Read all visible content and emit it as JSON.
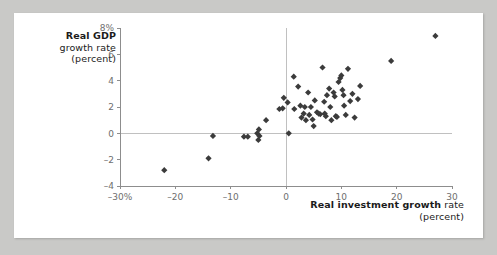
{
  "page": {
    "background_color": "#c9c9c7",
    "card_background": "#ffffff"
  },
  "axes": {
    "y_title_strong": "Real GDP",
    "y_title_rest": "growth rate (percent)",
    "x_title_strong": "Real investment growth",
    "x_title_rest": "rate (percent)"
  },
  "chart_data": {
    "type": "scatter",
    "title": "",
    "xlabel": "Real investment growth rate (percent)",
    "ylabel": "Real GDP growth rate (percent)",
    "xlim": [
      -30,
      30
    ],
    "ylim": [
      -4,
      8
    ],
    "xticks": [
      -30,
      -20,
      -10,
      0,
      10,
      20,
      30
    ],
    "xticklabels": [
      "-30%",
      "-20",
      "-10",
      "0",
      "10",
      "20",
      "30"
    ],
    "yticks": [
      -4,
      -2,
      0,
      2,
      4,
      6,
      8
    ],
    "yticklabels": [
      "-4",
      "-2",
      "0",
      "2",
      "4",
      "6",
      "8%"
    ],
    "grid": false,
    "legend": null,
    "marker_color": "#3b3b3b",
    "marker_shape": "diamond",
    "marker_size": 4,
    "zero_lines": {
      "x": 0,
      "y": 0,
      "color": "#c0c0c0"
    },
    "points": [
      [
        -22.0,
        -2.8
      ],
      [
        -14.0,
        -1.9
      ],
      [
        -13.2,
        -0.2
      ],
      [
        -7.6,
        -0.25
      ],
      [
        -6.9,
        -0.25
      ],
      [
        -5.2,
        0.0
      ],
      [
        -5.0,
        -0.5
      ],
      [
        -4.9,
        0.3
      ],
      [
        -4.8,
        -0.2
      ],
      [
        -3.6,
        1.0
      ],
      [
        -1.2,
        1.85
      ],
      [
        -0.6,
        1.9
      ],
      [
        -0.4,
        2.7
      ],
      [
        1.4,
        4.3
      ],
      [
        1.5,
        1.85
      ],
      [
        2.2,
        3.55
      ],
      [
        0.3,
        2.35
      ],
      [
        0.5,
        0.0
      ],
      [
        2.6,
        2.1
      ],
      [
        2.8,
        1.2
      ],
      [
        3.2,
        1.5
      ],
      [
        3.4,
        2.0
      ],
      [
        3.6,
        1.0
      ],
      [
        4.0,
        3.1
      ],
      [
        4.2,
        1.4
      ],
      [
        4.5,
        2.0
      ],
      [
        4.8,
        1.05
      ],
      [
        5.0,
        0.55
      ],
      [
        5.2,
        2.5
      ],
      [
        5.6,
        1.6
      ],
      [
        5.9,
        1.5
      ],
      [
        6.2,
        1.45
      ],
      [
        6.6,
        5.0
      ],
      [
        6.9,
        2.4
      ],
      [
        7.0,
        1.5
      ],
      [
        7.2,
        1.3
      ],
      [
        7.4,
        2.9
      ],
      [
        7.8,
        3.4
      ],
      [
        8.0,
        2.0
      ],
      [
        8.2,
        1.0
      ],
      [
        8.6,
        3.1
      ],
      [
        8.8,
        2.8
      ],
      [
        9.0,
        1.3
      ],
      [
        9.2,
        1.25
      ],
      [
        9.5,
        3.9
      ],
      [
        9.8,
        4.2
      ],
      [
        10.0,
        4.4
      ],
      [
        10.2,
        3.3
      ],
      [
        10.4,
        2.9
      ],
      [
        10.5,
        2.1
      ],
      [
        10.8,
        1.4
      ],
      [
        11.2,
        4.9
      ],
      [
        11.6,
        2.45
      ],
      [
        12.0,
        3.0
      ],
      [
        12.4,
        1.2
      ],
      [
        13.0,
        2.6
      ],
      [
        13.4,
        3.6
      ],
      [
        19.0,
        5.5
      ],
      [
        27.0,
        7.4
      ]
    ]
  }
}
